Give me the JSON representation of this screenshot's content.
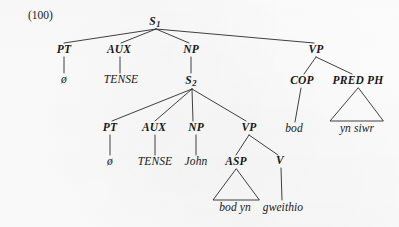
{
  "figure": {
    "example_number": "(100)",
    "kind": "phrase-structure-tree",
    "language_data": "Welsh"
  },
  "nodes": {
    "s1": {
      "label": "S",
      "subscript": "1",
      "x": 155,
      "y": 22
    },
    "pt1": {
      "label": "PT",
      "x": 64,
      "y": 50
    },
    "aux1": {
      "label": "AUX",
      "x": 119,
      "y": 50
    },
    "np1": {
      "label": "NP",
      "x": 191,
      "y": 50
    },
    "vp1": {
      "label": "VP",
      "x": 316,
      "y": 50
    },
    "null1": {
      "label": "ø",
      "x": 64,
      "y": 80
    },
    "tense1": {
      "label": "TENSE",
      "x": 121,
      "y": 80
    },
    "s2": {
      "label": "S",
      "subscript": "2",
      "x": 191,
      "y": 81
    },
    "cop": {
      "label": "COP",
      "x": 302,
      "y": 81
    },
    "predph": {
      "label": "PRED PH",
      "x": 358,
      "y": 81
    },
    "pt2": {
      "label": "PT",
      "x": 110,
      "y": 128
    },
    "aux2": {
      "label": "AUX",
      "x": 154,
      "y": 128
    },
    "np2": {
      "label": "NP",
      "x": 196,
      "y": 128
    },
    "vp2": {
      "label": "VP",
      "x": 249,
      "y": 128
    },
    "bod": {
      "label": "bod",
      "x": 294,
      "y": 129
    },
    "ynsiwr": {
      "label": "yn siwr",
      "x": 357,
      "y": 129
    },
    "null2": {
      "label": "ø",
      "x": 110,
      "y": 162
    },
    "tense2": {
      "label": "TENSE",
      "x": 155,
      "y": 162
    },
    "john": {
      "label": "John",
      "x": 196,
      "y": 162
    },
    "asp": {
      "label": "ASP",
      "x": 236,
      "y": 162
    },
    "v": {
      "label": "V",
      "x": 280,
      "y": 161
    },
    "bodyn": {
      "label": "bod yn",
      "x": 235,
      "y": 208
    },
    "gweithio": {
      "label": "gweithio",
      "x": 283,
      "y": 208
    }
  },
  "edges": [
    {
      "from": "s1",
      "to": "pt1"
    },
    {
      "from": "s1",
      "to": "aux1"
    },
    {
      "from": "s1",
      "to": "np1"
    },
    {
      "from": "s1",
      "to": "vp1"
    },
    {
      "from": "pt1",
      "to": "null1"
    },
    {
      "from": "aux1",
      "to": "tense1"
    },
    {
      "from": "np1",
      "to": "s2"
    },
    {
      "from": "vp1",
      "to": "cop"
    },
    {
      "from": "vp1",
      "to": "predph"
    },
    {
      "from": "s2",
      "to": "pt2"
    },
    {
      "from": "s2",
      "to": "aux2"
    },
    {
      "from": "s2",
      "to": "np2"
    },
    {
      "from": "s2",
      "to": "vp2"
    },
    {
      "from": "cop",
      "to": "bod"
    },
    {
      "from": "pt2",
      "to": "null2"
    },
    {
      "from": "aux2",
      "to": "tense2"
    },
    {
      "from": "np2",
      "to": "john"
    },
    {
      "from": "vp2",
      "to": "asp"
    },
    {
      "from": "vp2",
      "to": "v"
    },
    {
      "from": "v",
      "to": "gweithio"
    }
  ],
  "triangles": [
    {
      "name": "pred-ph-triangle",
      "apex_x": 358,
      "apex_y": 88,
      "left_x": 330,
      "right_x": 383,
      "base_y": 121,
      "spans": "yn siwr"
    },
    {
      "name": "asp-triangle",
      "apex_x": 236,
      "apex_y": 169,
      "left_x": 213,
      "right_x": 259,
      "base_y": 200,
      "spans": "bod yn"
    }
  ],
  "colors": {
    "ink": "#18181a",
    "paper": "#fcfcfc",
    "line": "#2a2a2c"
  }
}
